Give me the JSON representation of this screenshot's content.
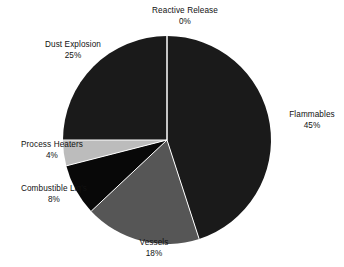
{
  "chart_data": {
    "type": "pie",
    "title": "",
    "subtitle": "",
    "xlabel": "",
    "ylabel": "",
    "legend_position": "none",
    "grid": false,
    "value_unit": "percent",
    "start_angle_deg": 0,
    "direction": "clockwise",
    "categories": [
      "Reactive Release",
      "Flammables",
      "Vessels",
      "Combustible Liq's",
      "Process Heaters",
      "Dust Explosion"
    ],
    "values": [
      0,
      45,
      18,
      8,
      4,
      25
    ],
    "slices": [
      {
        "label": "Reactive Release",
        "value": 0,
        "value_text": "0%",
        "color": "#1a1a1a",
        "start_deg": 0,
        "end_deg": 0
      },
      {
        "label": "Flammables",
        "value": 45,
        "value_text": "45%",
        "color": "#1a1a1a",
        "start_deg": 0,
        "end_deg": 162
      },
      {
        "label": "Vessels",
        "value": 18,
        "value_text": "18%",
        "color": "#565656",
        "start_deg": 162,
        "end_deg": 226.8
      },
      {
        "label": "Combustible Liq's",
        "value": 8,
        "value_text": "8%",
        "color": "#080808",
        "start_deg": 226.8,
        "end_deg": 255.6
      },
      {
        "label": "Process Heaters",
        "value": 4,
        "value_text": "4%",
        "color": "#bcbcbc",
        "start_deg": 255.6,
        "end_deg": 270
      },
      {
        "label": "Dust Explosion",
        "value": 25,
        "value_text": "25%",
        "color": "#1a1a1a",
        "start_deg": 270,
        "end_deg": 360
      }
    ],
    "geometry": {
      "center_x": 167,
      "center_y": 140,
      "radius": 104
    },
    "colors": {
      "background": "#ffffff",
      "text": "#111111",
      "dark_slice": "#1a1a1a",
      "black_slice": "#080808",
      "mid_gray_slice": "#565656",
      "light_gray_slice": "#bcbcbc",
      "divider": "#ffffff"
    }
  },
  "labels": {
    "reactive_release": {
      "name": "Reactive Release",
      "pct": "0%"
    },
    "dust_explosion": {
      "name": "Dust Explosion",
      "pct": "25%"
    },
    "flammables": {
      "name": "Flammables",
      "pct": "45%"
    },
    "process_heaters": {
      "name": "Process Heaters",
      "pct": "4%"
    },
    "combustible_liqs": {
      "name": "Combustible Liq's",
      "pct": "8%"
    },
    "vessels": {
      "name": "Vessels",
      "pct": "18%"
    }
  }
}
